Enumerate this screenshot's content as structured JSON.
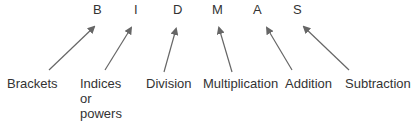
{
  "items": [
    {
      "letter": "B",
      "label": "Brackets"
    },
    {
      "letter": "I",
      "label": "Indices\nor\npowers"
    },
    {
      "letter": "D",
      "label": "Division"
    },
    {
      "letter": "M",
      "label": "Multiplication"
    },
    {
      "letter": "A",
      "label": "Addition"
    },
    {
      "letter": "S",
      "label": "Subtraction"
    }
  ],
  "colors": {
    "arrow": "#666666",
    "text": "#333333"
  }
}
